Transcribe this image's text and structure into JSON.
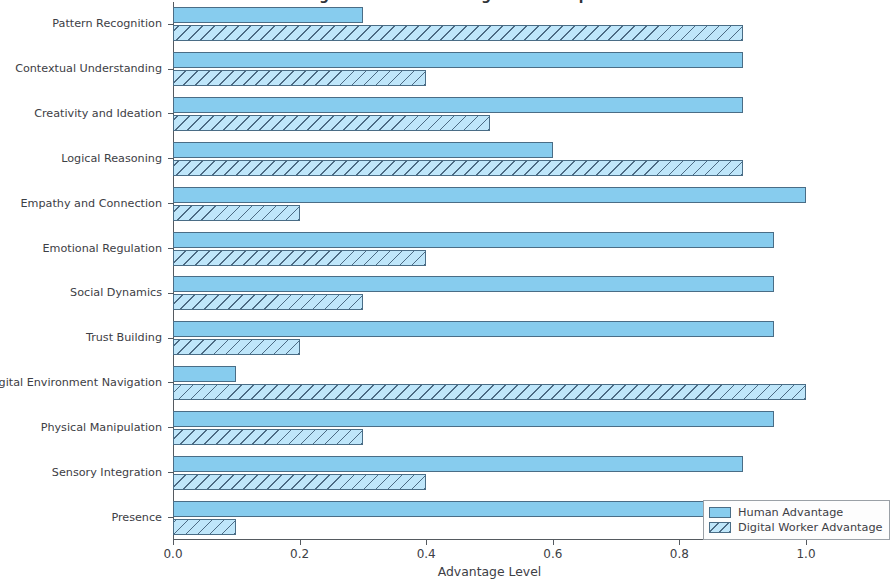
{
  "chart_data": {
    "type": "bar",
    "orientation": "horizontal",
    "title": "Human vs Digital Worker Advantage Across Capabilities",
    "xlabel": "Advantage Level",
    "ylabel": "",
    "xlim": [
      0.0,
      1.1
    ],
    "xticks": [
      0.0,
      0.2,
      0.4,
      0.6,
      0.8,
      1.0
    ],
    "xticklabels": [
      "0.0",
      "0.2",
      "0.4",
      "0.6",
      "0.8",
      "1.0"
    ],
    "grid": false,
    "legend_position": "lower right",
    "categories": [
      "Pattern Recognition",
      "Contextual Understanding",
      "Creativity and Ideation",
      "Logical Reasoning",
      "Empathy and Connection",
      "Emotional Regulation",
      "Social Dynamics",
      "Trust Building",
      "Digital Environment Navigation",
      "Physical Manipulation",
      "Sensory Integration",
      "Presence"
    ],
    "series": [
      {
        "name": "Human Advantage",
        "color": "#87ccee",
        "hatch": "",
        "values": [
          0.3,
          0.9,
          0.9,
          0.6,
          1.0,
          0.95,
          0.95,
          0.95,
          0.1,
          0.95,
          0.9,
          1.0
        ]
      },
      {
        "name": "Digital Worker Advantage",
        "color": "#bfe6fa",
        "hatch": "///",
        "values": [
          0.9,
          0.4,
          0.5,
          0.9,
          0.2,
          0.4,
          0.3,
          0.2,
          1.0,
          0.3,
          0.4,
          0.1
        ]
      }
    ]
  },
  "axis": {
    "edge_color": "#555a60"
  }
}
